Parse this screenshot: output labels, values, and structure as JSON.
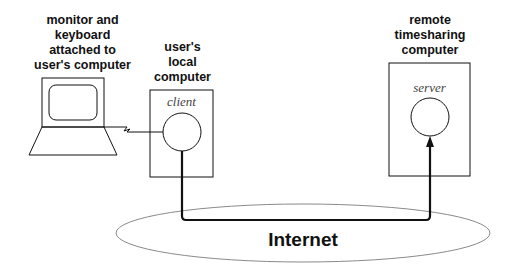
{
  "labels": {
    "monitor": "monitor and\nkeyboard\nattached to\nuser's computer",
    "local": "user's\nlocal\ncomputer",
    "remote": "remote\ntimesharing\ncomputer"
  },
  "nodes": {
    "client": {
      "label": "client"
    },
    "server": {
      "label": "server"
    }
  },
  "network": {
    "label": "Internet"
  },
  "colors": {
    "stroke": "#111111",
    "ellipse": "#888888"
  }
}
